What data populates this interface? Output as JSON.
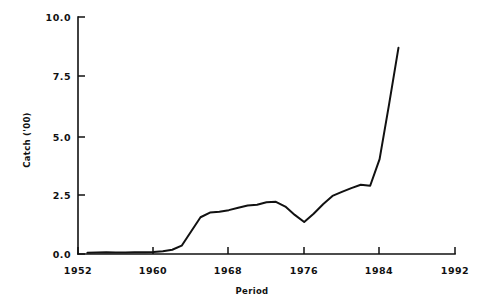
{
  "chart_data": {
    "type": "line",
    "title": "",
    "xlabel": "Period",
    "ylabel": "Catch ('00)",
    "xlim": [
      1952,
      1992
    ],
    "ylim": [
      0.0,
      10.0
    ],
    "grid": false,
    "legend": "none",
    "xticks": [
      1952,
      1960,
      1968,
      1976,
      1984,
      1992
    ],
    "xtick_labels": [
      "1952",
      "1960",
      "1968",
      "1976",
      "1984",
      "1992"
    ],
    "yticks": [
      0.0,
      2.5,
      5.0,
      7.5,
      10.0
    ],
    "ytick_labels": [
      "0.0",
      "2.5",
      "5.0",
      "7.5",
      "10.0"
    ],
    "series": [
      {
        "name": "Catch",
        "color": "#111111",
        "x": [
          1953,
          1954,
          1955,
          1956,
          1957,
          1958,
          1959,
          1960,
          1961,
          1962,
          1963,
          1964,
          1965,
          1966,
          1967,
          1968,
          1969,
          1970,
          1971,
          1972,
          1973,
          1974,
          1975,
          1976,
          1977,
          1978,
          1979,
          1980,
          1981,
          1982,
          1983,
          1984,
          1985,
          1986
        ],
        "y": [
          0.05,
          0.06,
          0.07,
          0.06,
          0.06,
          0.07,
          0.07,
          0.08,
          0.12,
          0.18,
          0.35,
          0.95,
          1.55,
          1.75,
          1.78,
          1.85,
          1.95,
          2.05,
          2.08,
          2.18,
          2.2,
          2.0,
          1.65,
          1.35,
          1.7,
          2.1,
          2.45,
          2.62,
          2.78,
          2.92,
          2.88,
          4.0,
          6.3,
          8.7
        ]
      }
    ]
  },
  "axis": {
    "y_label": "Catch ('00)",
    "x_label": "Period"
  }
}
